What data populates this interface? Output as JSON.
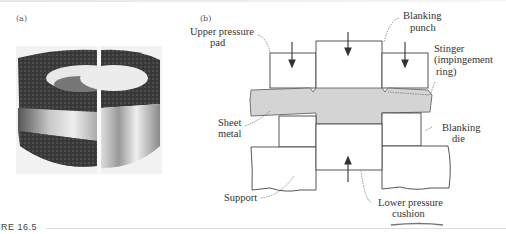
{
  "figure": {
    "caption_fragment": "URE 16.5",
    "panel_a": {
      "label": "(a)",
      "image_description": "photograph of fine-blanked part, cut in half showing smooth sheared edge"
    },
    "panel_b": {
      "label": "(b)",
      "labels": {
        "upper_pressure_pad_1": "Upper pressure",
        "upper_pressure_pad_2": "pad",
        "blanking_punch_1": "Blanking",
        "blanking_punch_2": "punch",
        "stinger_1": "Stinger",
        "stinger_2": "(impingement",
        "stinger_3": "ring)",
        "sheet_metal_1": "Sheet",
        "sheet_metal_2": "metal",
        "blanking_die_1": "Blanking",
        "blanking_die_2": "die",
        "support": "Support",
        "lower_pressure_cushion_1": "Lower pressure",
        "lower_pressure_cushion_2": "cushion"
      },
      "colors": {
        "sheet_metal_fill": "#d4d4d4",
        "line": "#444444"
      }
    }
  }
}
